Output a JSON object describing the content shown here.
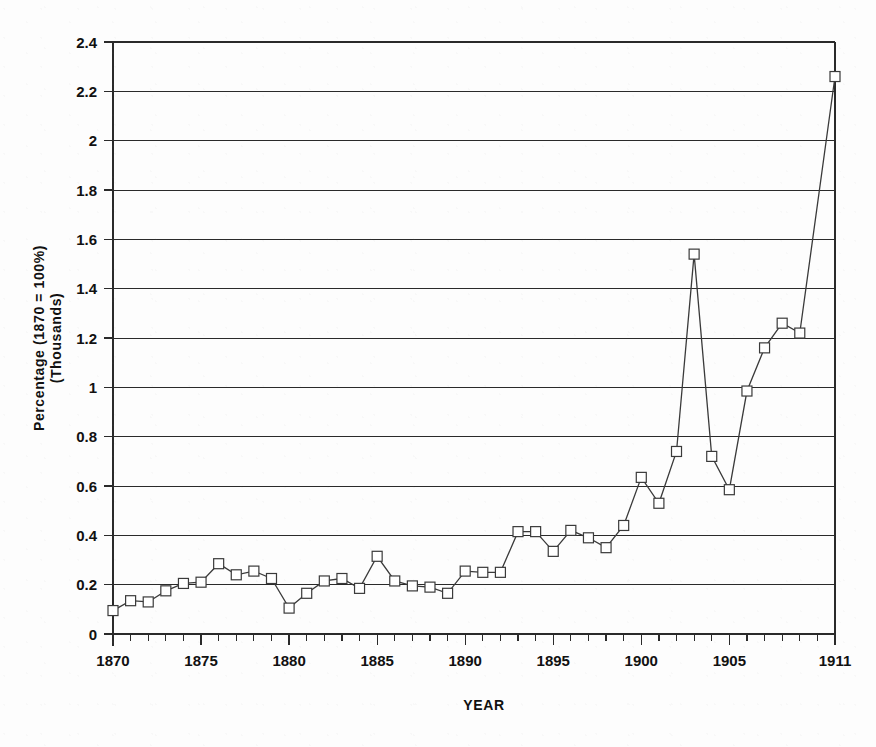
{
  "chart_data": {
    "type": "line",
    "title": "",
    "subtitle": "",
    "xlabel": "YEAR",
    "ylabel": "Percentage (1870 = 100%)\n(Thousands)",
    "ylabel_line1": "Percentage (1870 = 100%)",
    "ylabel_line2": "(Thousands)",
    "xlim": [
      1870,
      1911
    ],
    "ylim": [
      0,
      2.4
    ],
    "grid": true,
    "legend": false,
    "legend_position": "none",
    "marker": "open-square",
    "x_tick_labels": [
      "1870",
      "1875",
      "1880",
      "1885",
      "1890",
      "1895",
      "1900",
      "1905",
      "1911"
    ],
    "x_tick_values": [
      1870,
      1875,
      1880,
      1885,
      1890,
      1895,
      1900,
      1905,
      1911
    ],
    "x_minor_tick_step": 1,
    "y_tick_labels": [
      "0",
      "0.2",
      "0.4",
      "0.6",
      "0.8",
      "1",
      "1.2",
      "1.4",
      "1.6",
      "1.8",
      "2",
      "2.2",
      "2.4"
    ],
    "y_tick_values": [
      0,
      0.2,
      0.4,
      0.6,
      0.8,
      1.0,
      1.2,
      1.4,
      1.6,
      1.8,
      2.0,
      2.2,
      2.4
    ],
    "x": [
      1870,
      1871,
      1872,
      1873,
      1874,
      1875,
      1876,
      1877,
      1878,
      1879,
      1880,
      1881,
      1882,
      1883,
      1884,
      1885,
      1886,
      1887,
      1888,
      1889,
      1890,
      1891,
      1892,
      1893,
      1894,
      1895,
      1896,
      1897,
      1898,
      1899,
      1900,
      1901,
      1902,
      1903,
      1904,
      1905,
      1906,
      1907,
      1908,
      1909,
      1911
    ],
    "values": [
      0.095,
      0.135,
      0.13,
      0.175,
      0.205,
      0.21,
      0.285,
      0.24,
      0.255,
      0.225,
      0.105,
      0.165,
      0.215,
      0.225,
      0.185,
      0.315,
      0.215,
      0.195,
      0.19,
      0.165,
      0.255,
      0.25,
      0.25,
      0.415,
      0.415,
      0.335,
      0.42,
      0.39,
      0.35,
      0.44,
      0.635,
      0.53,
      0.74,
      1.54,
      0.72,
      0.585,
      0.985,
      1.16,
      1.26,
      1.22,
      2.26
    ],
    "series": [
      {
        "name": "",
        "values": [
          0.095,
          0.135,
          0.13,
          0.175,
          0.205,
          0.21,
          0.285,
          0.24,
          0.255,
          0.225,
          0.105,
          0.165,
          0.215,
          0.225,
          0.185,
          0.315,
          0.215,
          0.195,
          0.19,
          0.165,
          0.255,
          0.25,
          0.25,
          0.415,
          0.415,
          0.335,
          0.42,
          0.39,
          0.35,
          0.44,
          0.635,
          0.53,
          0.74,
          1.54,
          0.72,
          0.585,
          0.985,
          1.16,
          1.26,
          1.22,
          2.26
        ]
      }
    ],
    "annotations": [],
    "colors": {
      "line": "#3a3a3a",
      "marker_face": "#ffffff",
      "marker_edge": "#3a3a3a",
      "grid": "#2a2a2a",
      "axis": "#2a2a2a",
      "text": "#111111",
      "background": "#fdfdfd"
    }
  }
}
